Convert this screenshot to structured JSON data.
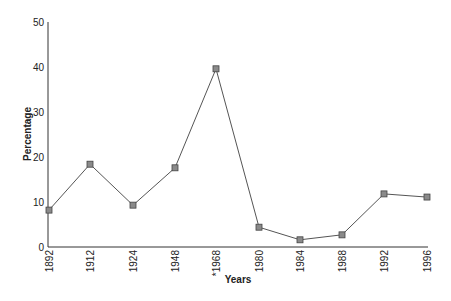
{
  "chart_data": {
    "type": "line",
    "title": "",
    "xlabel": "Years",
    "ylabel": "Percentage",
    "categories": [
      "1892",
      "1912",
      "1924",
      "1948",
      "*1968",
      "1980",
      "1984",
      "1988",
      "1992",
      "1996"
    ],
    "series": [
      {
        "name": "Percentage",
        "values": [
          8.2,
          18.4,
          9.3,
          17.6,
          39.6,
          4.4,
          1.6,
          2.7,
          11.8,
          11.1
        ]
      }
    ],
    "ylim": [
      0,
      50
    ],
    "yticks": [
      0,
      10,
      20,
      30,
      40,
      50
    ],
    "grid": false,
    "legend": "none",
    "marker": "square",
    "colors": {
      "line": "#555555",
      "marker_fill": "#8a8a8a",
      "marker_stroke": "#444444",
      "axis": "#333333",
      "text": "#222222"
    }
  }
}
